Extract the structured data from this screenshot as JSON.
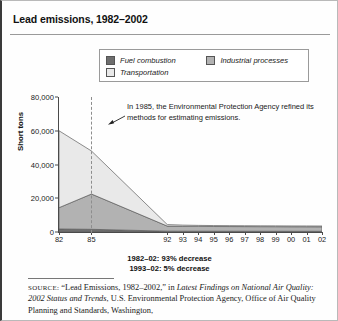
{
  "figure": {
    "title": "Lead emissions, 1982–2002"
  },
  "legend": {
    "items": [
      {
        "label": "Fuel combustion",
        "color": "#6e6e6e",
        "key": "fuel"
      },
      {
        "label": "Industrial processes",
        "color": "#b2b2b2",
        "key": "industrial"
      },
      {
        "label": "Transportation",
        "color": "#e9e9e9",
        "key": "transportation"
      }
    ]
  },
  "annotation": {
    "text": "In 1985, the Environmental Protection Agency refined its methods for estimating emissions.",
    "marker_year": "85"
  },
  "footnotes": {
    "line1": "1982–02: 93% decrease",
    "line2": "1993–02: 5% decrease"
  },
  "source": {
    "label": "SOURCE:",
    "part1": " “Lead Emissions, 1982–2002,” in ",
    "italic1": "Latest Findings on National Air Quality: 2002 Status and Trends",
    "part2": ", U.S. Environmental Protection Agency, Office of Air Quality Planning and Standards, Washington,"
  },
  "chart_data": {
    "type": "area",
    "stacked": true,
    "title": "Lead emissions, 1982–2002",
    "xlabel": "",
    "ylabel": "Short tons",
    "ylim": [
      0,
      80000
    ],
    "yticks": [
      0,
      20000,
      40000,
      60000,
      80000
    ],
    "ytick_labels": [
      "0",
      "20,000",
      "40,000",
      "60,000",
      "80,000"
    ],
    "grid": false,
    "legend_position": "top",
    "x": [
      1982,
      1985,
      1992,
      1993,
      1994,
      1995,
      1996,
      1997,
      1998,
      1999,
      2000,
      2001,
      2002
    ],
    "xtick_labels": [
      "82",
      "85",
      "92",
      "93",
      "94",
      "95",
      "96",
      "97",
      "98",
      "99",
      "00",
      "01",
      "02"
    ],
    "xtick_visible": [
      "82",
      "85",
      "92",
      "93",
      "94",
      "95",
      "96",
      "97",
      "98",
      "99",
      "00",
      "01",
      "02"
    ],
    "series": [
      {
        "name": "Fuel combustion",
        "color": "#6e6e6e",
        "values": [
          1800,
          1600,
          500,
          480,
          470,
          460,
          450,
          440,
          430,
          430,
          420,
          420,
          410
        ]
      },
      {
        "name": "Industrial processes",
        "color": "#b2b2b2",
        "values": [
          12600,
          20900,
          3000,
          2900,
          2850,
          2800,
          2780,
          2760,
          2740,
          2720,
          2700,
          2690,
          2680
        ]
      },
      {
        "name": "Transportation",
        "color": "#e9e9e9",
        "values": [
          45600,
          25500,
          900,
          700,
          600,
          560,
          540,
          520,
          500,
          490,
          480,
          470,
          460
        ]
      }
    ],
    "totals": [
      60000,
      48000,
      4400,
      4080,
      3920,
      3820,
      3770,
      3720,
      3670,
      3640,
      3600,
      3580,
      3550
    ],
    "annotations": [
      {
        "text": "In 1985, the Environmental Protection Agency refined its methods for estimating emissions.",
        "at_x": 1985
      },
      {
        "text": "1982–02: 93% decrease"
      },
      {
        "text": "1993–02: 5% decrease"
      }
    ]
  }
}
